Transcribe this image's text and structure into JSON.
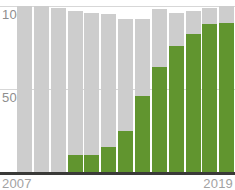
{
  "chart_data": {
    "type": "bar",
    "title": "",
    "subtitle": "",
    "xlabel": "",
    "ylabel": "",
    "ylim": [
      0,
      100
    ],
    "grid": true,
    "gridlines": [
      50,
      100
    ],
    "legend_position": "none",
    "stacked": true,
    "categories": [
      "2007",
      "2008",
      "2009",
      "2010",
      "2011",
      "2012",
      "2013",
      "2014",
      "2015",
      "2016",
      "2017",
      "2018",
      "2019"
    ],
    "y_tick_labels": [
      "50",
      "100"
    ],
    "x_tick_labels": [
      "2007",
      "2019"
    ],
    "colors": {
      "value_series": "#61952f",
      "remainder_series": "#cdcdcd",
      "gridline": "#d7d7d7",
      "axis_line": "#3a3a38",
      "label_text": "#8e8e8e",
      "background": "#ffffff"
    },
    "series": [
      {
        "name": "value",
        "color": "#61952f",
        "values": [
          0,
          0,
          0,
          10,
          10,
          15,
          25,
          46,
          63,
          76,
          83,
          89,
          90
        ]
      },
      {
        "name": "total",
        "color": "#cdcdcd",
        "values": [
          100,
          100,
          99,
          97,
          96,
          95,
          92,
          92,
          98,
          96,
          97,
          99,
          100
        ]
      }
    ]
  },
  "axis": {
    "y_max_label": "100",
    "y_mid_label": "50",
    "x_start_label": "2007",
    "x_end_label": "2019"
  }
}
